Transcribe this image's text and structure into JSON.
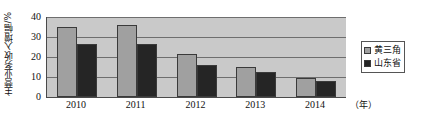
{
  "chart_data": {
    "type": "bar",
    "title": "",
    "xlabel": "（年）",
    "ylabel": "主营业务收入增幅/%",
    "categories": [
      "2010",
      "2011",
      "2012",
      "2013",
      "2014"
    ],
    "series": [
      {
        "name": "黄三角",
        "color": "#a0a0a0",
        "values": [
          35.0,
          35.8,
          21.4,
          14.8,
          9.3
        ]
      },
      {
        "name": "山东省",
        "color": "#252525",
        "values": [
          26.3,
          26.6,
          15.8,
          12.3,
          8.0
        ]
      }
    ],
    "ylim": [
      0,
      40
    ],
    "yticks": [
      0,
      10,
      20,
      30,
      40
    ],
    "ytick_labels": [
      "0",
      "10",
      "20",
      "30",
      "40"
    ],
    "grid": true,
    "legend_position": "right",
    "plot_background": "#c9c9c9",
    "axis_color": "#4a4a4a"
  }
}
